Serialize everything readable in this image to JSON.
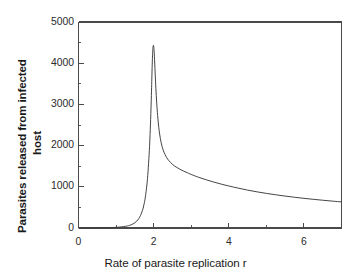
{
  "chart_data": {
    "type": "line",
    "title": "",
    "xlabel": "Rate of parasite replication r",
    "ylabel_line1": "Parasites released from infected",
    "ylabel_line2": "host",
    "xlim": [
      0,
      7
    ],
    "ylim": [
      0,
      5000
    ],
    "grid": false,
    "legend": "none",
    "xticks": [
      0,
      2,
      4,
      6
    ],
    "xtick_labels": [
      "0",
      "2",
      "4",
      "6"
    ],
    "xminor_step": 1,
    "yticks": [
      0,
      1000,
      2000,
      3000,
      4000,
      5000
    ],
    "ytick_labels": [
      "0",
      "1000",
      "2000",
      "3000",
      "4000",
      "5000"
    ],
    "yminor_step": 500,
    "line_color": "#3a3a3a",
    "axis_color": "#4a4a4a",
    "background": "#ffffff",
    "series": [
      {
        "name": "parasites released",
        "x": [
          0.0,
          0.2,
          0.4,
          0.6,
          0.8,
          1.0,
          1.1,
          1.2,
          1.3,
          1.35,
          1.4,
          1.45,
          1.5,
          1.55,
          1.6,
          1.65,
          1.7,
          1.74,
          1.78,
          1.82,
          1.85,
          1.88,
          1.9,
          1.92,
          1.94,
          1.95,
          1.96,
          1.97,
          1.98,
          1.99,
          2.0,
          2.01,
          2.02,
          2.04,
          2.06,
          2.08,
          2.1,
          2.13,
          2.16,
          2.2,
          2.25,
          2.3,
          2.35,
          2.4,
          2.5,
          2.6,
          2.7,
          2.8,
          2.9,
          3.0,
          3.2,
          3.4,
          3.6,
          3.8,
          4.0,
          4.25,
          4.5,
          4.75,
          5.0,
          5.25,
          5.5,
          5.75,
          6.0,
          6.25,
          6.5,
          6.75,
          7.0
        ],
        "y": [
          0,
          1,
          2,
          4,
          8,
          16,
          23,
          33,
          49,
          61,
          77,
          98,
          127,
          167,
          223,
          303,
          420,
          558,
          755,
          1045,
          1360,
          1790,
          2160,
          2630,
          3220,
          3560,
          3900,
          4180,
          4360,
          4430,
          4420,
          4330,
          4170,
          3760,
          3380,
          3060,
          2800,
          2500,
          2280,
          2070,
          1900,
          1790,
          1705,
          1640,
          1545,
          1480,
          1425,
          1380,
          1340,
          1300,
          1230,
          1170,
          1115,
          1065,
          1020,
          968,
          920,
          878,
          840,
          806,
          775,
          746,
          720,
          696,
          674,
          653,
          633
        ]
      }
    ],
    "peak": {
      "x": 2.0,
      "y": 4420
    }
  }
}
